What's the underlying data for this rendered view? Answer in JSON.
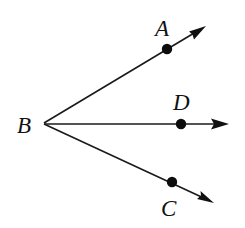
{
  "diagram": {
    "type": "rays-from-common-vertex",
    "colors": {
      "stroke": "#1a1a1a",
      "point": "#0d0d0d",
      "background": "#ffffff"
    },
    "vertex": {
      "id": "B",
      "label": "B",
      "x": 44,
      "y": 123,
      "label_x": 17,
      "label_y": 133
    },
    "rays": [
      {
        "id": "BA",
        "point_label": "A",
        "point": {
          "x": 167,
          "y": 49
        },
        "arrow_tip": {
          "x": 206,
          "y": 26
        },
        "label_pos": {
          "x": 155,
          "y": 36
        }
      },
      {
        "id": "BD",
        "point_label": "D",
        "point": {
          "x": 181,
          "y": 124
        },
        "arrow_tip": {
          "x": 229,
          "y": 124
        },
        "label_pos": {
          "x": 173,
          "y": 110
        }
      },
      {
        "id": "BC",
        "point_label": "C",
        "point": {
          "x": 172,
          "y": 182
        },
        "arrow_tip": {
          "x": 214,
          "y": 203
        },
        "label_pos": {
          "x": 161,
          "y": 215
        }
      }
    ]
  }
}
